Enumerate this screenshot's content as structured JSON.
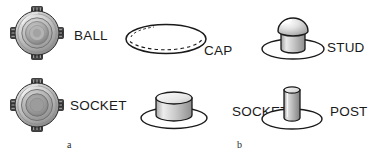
{
  "figure": {
    "background_color": "#ffffff",
    "line_color": "#1a1a1a",
    "text_color": "#1a1a1a"
  },
  "panels": [
    {
      "caption": "a",
      "caption_position": {
        "x": 67,
        "y": 140
      },
      "items": [
        {
          "id": "ball",
          "label": "BALL",
          "icon": "ring-snap-ball-icon",
          "label_position": {
            "x": 74,
            "y": 29
          },
          "icon_position": {
            "x": 10,
            "y": 6
          },
          "icon_size": {
            "w": 54,
            "h": 54
          },
          "description": "Circular metal snap ring with four prongs, concentric domed center"
        },
        {
          "id": "socket-a",
          "label": "SOCKET",
          "icon": "ring-snap-socket-icon",
          "label_position": {
            "x": 70,
            "y": 99
          },
          "icon_position": {
            "x": 10,
            "y": 78
          },
          "icon_size": {
            "w": 54,
            "h": 54
          },
          "description": "Circular metal snap ring with four prongs, concentric recessed center"
        }
      ]
    },
    {
      "caption": "b",
      "caption_position": {
        "x": 237,
        "y": 140
      },
      "items": [
        {
          "id": "cap",
          "label": "CAP",
          "icon": "ellipse-cap-outline-icon",
          "label_position": {
            "x": 204,
            "y": 44
          },
          "icon_position": {
            "x": 124,
            "y": 22
          },
          "icon_size": {
            "w": 82,
            "h": 34
          },
          "description": "Shallow domed disc drawn as an outlined ellipse with a dashed inner rim arc"
        },
        {
          "id": "stud",
          "label": "STUD",
          "icon": "dome-stud-on-base-icon",
          "label_position": {
            "x": 327,
            "y": 41
          },
          "icon_position": {
            "x": 258,
            "y": 16
          },
          "icon_size": {
            "w": 68,
            "h": 44
          },
          "description": "Mushroom-shaped dome post on a flat elliptical flange"
        },
        {
          "id": "socket-b",
          "label": "SOCKET",
          "icon": "cylinder-socket-on-base-icon",
          "label_position": {
            "x": 232,
            "y": 105
          },
          "icon_position": {
            "x": 136,
            "y": 87
          },
          "icon_size": {
            "w": 74,
            "h": 42
          },
          "description": "Short wide cylinder on a flat elliptical flange"
        },
        {
          "id": "post",
          "label": "POST",
          "icon": "cylinder-post-on-base-icon",
          "label_position": {
            "x": 330,
            "y": 105
          },
          "icon_position": {
            "x": 258,
            "y": 84
          },
          "icon_size": {
            "w": 66,
            "h": 46
          },
          "description": "Tall narrow cylinder on a flat elliptical flange"
        }
      ]
    }
  ]
}
